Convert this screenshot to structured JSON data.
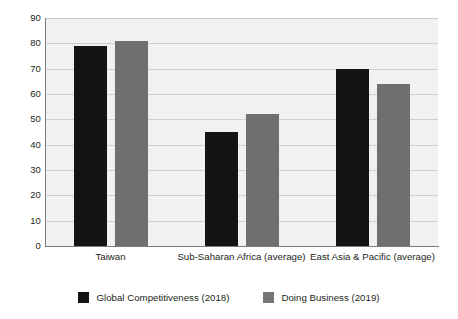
{
  "chart_data": {
    "type": "bar",
    "title": "",
    "subtitle": "",
    "xlabel": "",
    "ylabel": "",
    "ylim": [
      0,
      90
    ],
    "ytick_step": 10,
    "yticks": [
      90,
      80,
      70,
      60,
      50,
      40,
      30,
      20,
      10,
      0
    ],
    "grid": true,
    "legend_position": "bottom-center",
    "categories": [
      "Taiwan",
      "Sub-Saharan Africa (average)",
      "East Asia & Pacific (average)"
    ],
    "series": [
      {
        "name": "Global Competitiveness (2018)",
        "color": "#141414",
        "values": [
          79,
          45,
          70
        ]
      },
      {
        "name": "Doing Business (2019)",
        "color": "#6f6f6f",
        "values": [
          81,
          52,
          64
        ]
      }
    ]
  },
  "legend": {
    "entries": [
      {
        "label": "Global Competitiveness (2018)",
        "swatch": "#141414"
      },
      {
        "label": "Doing Business (2019)",
        "swatch": "#767676"
      }
    ]
  },
  "colors": {
    "series_0": "#141414",
    "series_1": "#6f6f6f",
    "plot_background": "#f1f1f1",
    "gridline": "#cfcfcf",
    "axis": "#7b7b7b",
    "text": "#231f20",
    "page_background": "#ffffff"
  }
}
